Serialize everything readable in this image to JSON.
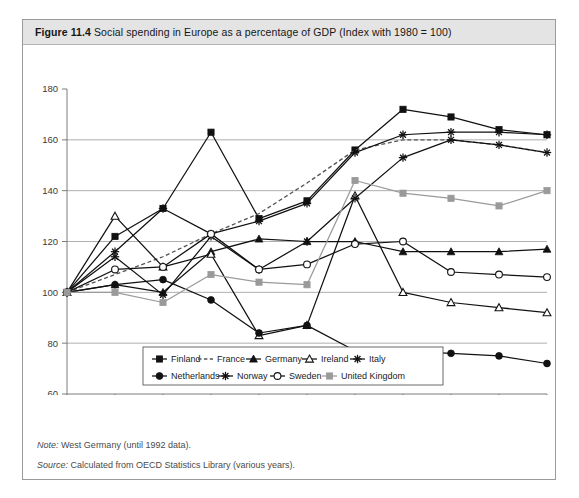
{
  "figure": {
    "number": "Figure 11.4",
    "caption": "Social spending in Europe as a percentage of GDP (Index with 1980 = 100)"
  },
  "notes": [
    {
      "label": "Note:",
      "text": "West Germany (until 1992 data)."
    },
    {
      "label": "Source:",
      "text": "Calculated from OECD Statistics Library (various years)."
    }
  ],
  "chart_data": {
    "type": "line",
    "title": "Social spending in Europe as a percentage of GDP (Index with 1980 = 100)",
    "xlabel": "",
    "ylabel": "",
    "categories": [
      "1980",
      "1985",
      "1990",
      "1995",
      "2000",
      "2005",
      "2010",
      "2015",
      "2016",
      "2017",
      "2018"
    ],
    "ylim": [
      60,
      180
    ],
    "yticks": [
      60,
      80,
      100,
      120,
      140,
      160,
      180
    ],
    "grid": true,
    "legend_position": "bottom",
    "series": [
      {
        "name": "Finland",
        "marker": "square-filled",
        "color": "#111111",
        "dash": "none",
        "values": [
          100,
          122,
          133,
          163,
          129,
          136,
          156,
          172,
          169,
          164,
          162
        ]
      },
      {
        "name": "France",
        "marker": "none",
        "color": "#555555",
        "dash": "dashed",
        "values": [
          100,
          107,
          114,
          123,
          131,
          143,
          156,
          160,
          160,
          158,
          155
        ]
      },
      {
        "name": "Germany",
        "marker": "triangle-filled",
        "color": "#111111",
        "dash": "none",
        "values": [
          100,
          103,
          100,
          116,
          121,
          120,
          120,
          116,
          116,
          116,
          117
        ]
      },
      {
        "name": "Ireland",
        "marker": "triangle-open",
        "color": "#111111",
        "dash": "none",
        "values": [
          100,
          130,
          110,
          115,
          83,
          87,
          138,
          100,
          96,
          94,
          92
        ]
      },
      {
        "name": "Italy",
        "marker": "star",
        "color": "#111111",
        "dash": "none",
        "values": [
          100,
          116,
          133,
          123,
          128,
          135,
          155,
          162,
          163,
          163,
          162
        ]
      },
      {
        "name": "Netherlands",
        "marker": "circle-filled",
        "color": "#111111",
        "dash": "none",
        "values": [
          100,
          103,
          105,
          97,
          84,
          87,
          77,
          77,
          76,
          75,
          72
        ]
      },
      {
        "name": "Norway",
        "marker": "star",
        "color": "#111111",
        "dash": "none",
        "values": [
          100,
          114,
          99,
          122,
          109,
          120,
          137,
          153,
          160,
          158,
          155
        ]
      },
      {
        "name": "Sweden",
        "marker": "circle-open",
        "color": "#111111",
        "dash": "none",
        "values": [
          100,
          109,
          110,
          123,
          109,
          111,
          119,
          120,
          108,
          107,
          106
        ]
      },
      {
        "name": "United Kingdom",
        "marker": "square-filled",
        "color": "#9a9a9a",
        "dash": "none",
        "values": [
          100,
          100,
          96,
          107,
          104,
          103,
          144,
          139,
          137,
          134,
          140
        ]
      }
    ]
  }
}
